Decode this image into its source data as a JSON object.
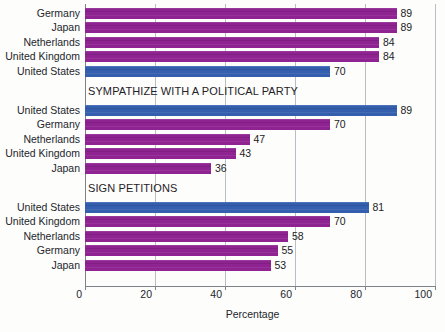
{
  "chart_data": {
    "type": "bar",
    "orientation": "horizontal",
    "title": "",
    "xlabel": "Percentage",
    "ylabel": "",
    "xlim": [
      0,
      100
    ],
    "xticks": [
      0,
      20,
      40,
      60,
      80,
      100
    ],
    "xtick_labels": [
      "0",
      "20",
      "40",
      "60",
      "80",
      "100"
    ],
    "grid": true,
    "legend": "none",
    "colors": {
      "purple": "#8f2391",
      "blue": "#335fae",
      "gridline": "#b9bec4",
      "axis": "#7d838a",
      "text": "#23262b",
      "background": "#fdfdfc"
    },
    "groups": [
      {
        "caption": "",
        "caption_position": "none",
        "bars": [
          {
            "label": "Germany",
            "value": 89,
            "color": "purple"
          },
          {
            "label": "Japan",
            "value": 89,
            "color": "purple"
          },
          {
            "label": "Netherlands",
            "value": 84,
            "color": "purple"
          },
          {
            "label": "United Kingdom",
            "value": 84,
            "color": "purple"
          },
          {
            "label": "United States",
            "value": 70,
            "color": "blue"
          }
        ]
      },
      {
        "caption": "SYMPATHIZE WITH A POLITICAL PARTY",
        "caption_position": "above",
        "bars": [
          {
            "label": "United States",
            "value": 89,
            "color": "blue"
          },
          {
            "label": "Germany",
            "value": 70,
            "color": "purple"
          },
          {
            "label": "Netherlands",
            "value": 47,
            "color": "purple"
          },
          {
            "label": "United Kingdom",
            "value": 43,
            "color": "purple"
          },
          {
            "label": "Japan",
            "value": 36,
            "color": "purple"
          }
        ]
      },
      {
        "caption": "SIGN PETITIONS",
        "caption_position": "above",
        "bars": [
          {
            "label": "United States",
            "value": 81,
            "color": "blue"
          },
          {
            "label": "United Kingdom",
            "value": 70,
            "color": "purple"
          },
          {
            "label": "Netherlands",
            "value": 58,
            "color": "purple"
          },
          {
            "label": "Germany",
            "value": 55,
            "color": "purple"
          },
          {
            "label": "Japan",
            "value": 53,
            "color": "purple"
          }
        ]
      }
    ]
  }
}
